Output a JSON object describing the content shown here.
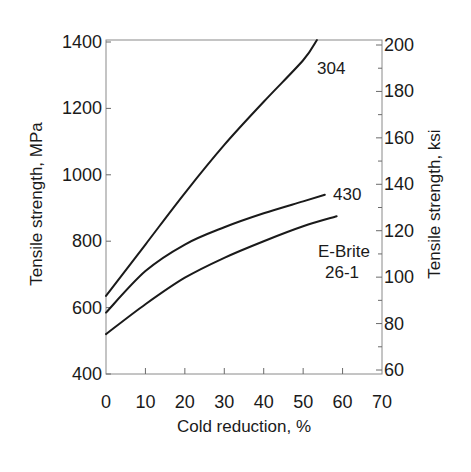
{
  "chart_data": {
    "type": "line",
    "title": "",
    "xlabel": "Cold reduction, %",
    "ylabel": "Tensile strength, MPa",
    "y2label": "Tensile strength, ksi",
    "xlim": [
      0,
      70
    ],
    "ylim": [
      400,
      1400
    ],
    "y2lim": [
      60,
      200
    ],
    "xticks": [
      0,
      10,
      20,
      30,
      40,
      50,
      60,
      70
    ],
    "yticks": [
      400,
      600,
      800,
      1000,
      1200,
      1400
    ],
    "y2ticks": [
      60,
      80,
      100,
      120,
      140,
      160,
      180,
      200
    ],
    "y2minor_ticks": [
      70,
      90,
      110,
      130,
      150,
      170,
      190
    ],
    "grid": false,
    "legend": "inline labels at curve ends",
    "series": [
      {
        "name": "304",
        "label_lines": [
          "304"
        ],
        "x": [
          0,
          10,
          20,
          30,
          40,
          50,
          53.5
        ],
        "values": [
          635,
          790,
          945,
          1090,
          1220,
          1345,
          1410
        ]
      },
      {
        "name": "430",
        "label_lines": [
          "430"
        ],
        "x": [
          0,
          10,
          20,
          30,
          40,
          50,
          55.5
        ],
        "values": [
          585,
          710,
          790,
          842,
          884,
          920,
          940
        ]
      },
      {
        "name": "E-Brite 26-1",
        "label_lines": [
          "E-Brite",
          "26-1"
        ],
        "x": [
          0,
          10,
          20,
          30,
          40,
          50,
          58.5
        ],
        "values": [
          520,
          610,
          690,
          750,
          800,
          845,
          875
        ]
      }
    ]
  },
  "layout": {
    "plot": {
      "left": 106,
      "right": 382,
      "top": 40,
      "bottom": 374
    },
    "y_px_top": 42,
    "y2_px_top": 45,
    "y2_px_bottom": 370,
    "series_label_pos": [
      {
        "x": 317,
        "y": 74
      },
      {
        "x": 333,
        "y": 200
      },
      {
        "x": 318,
        "y": 257,
        "line2_x": 325,
        "line2_y": 278
      }
    ]
  }
}
